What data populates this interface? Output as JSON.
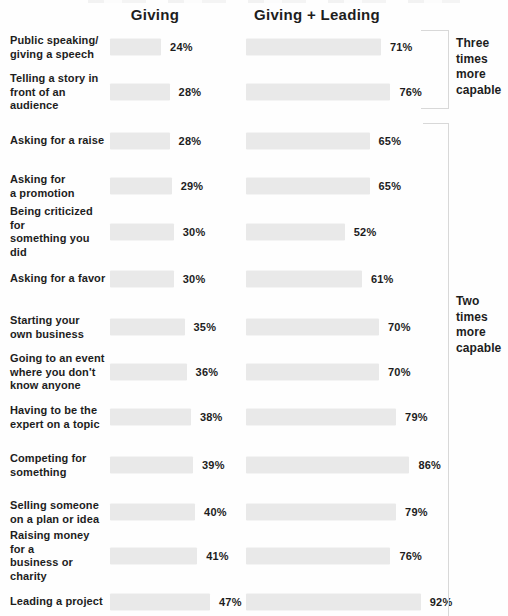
{
  "chart_data": {
    "type": "bar",
    "orientation": "horizontal",
    "title": "",
    "categories": [
      "Public speaking/\ngiving a speech",
      "Telling a story in\nfront of an audience",
      "Asking for a raise",
      "Asking for\na promotion",
      "Being criticized for\nsomething you did",
      "Asking for a favor",
      "Starting your\nown business",
      "Going to an event\nwhere you don't\nknow anyone",
      "Having to be the\nexpert on a topic",
      "Competing for\nsomething",
      "Selling someone\non a plan or idea",
      "Raising money for a\nbusiness or charity",
      "Leading a project"
    ],
    "series": [
      {
        "name": "Giving",
        "values": [
          24,
          28,
          28,
          29,
          30,
          30,
          35,
          36,
          38,
          39,
          40,
          41,
          47
        ]
      },
      {
        "name": "Giving + Leading",
        "values": [
          71,
          76,
          65,
          65,
          52,
          61,
          70,
          70,
          79,
          86,
          79,
          76,
          92
        ]
      }
    ],
    "value_suffix": "%",
    "annotations": [
      {
        "label": "Three times more capable",
        "applies_to_rows": [
          0,
          1
        ]
      },
      {
        "label": "Two times more capable",
        "applies_to_rows": [
          2,
          12
        ]
      }
    ],
    "legend_position": "top-as-column-headers",
    "grid": false,
    "bar_color": "#e9e9e9",
    "text_color": "#1d1d1d",
    "bracket_color": "#d8d8d8",
    "background_color": "#fefefe"
  },
  "headers": {
    "col1": "Giving",
    "col2": "Giving + Leading"
  },
  "annotations": {
    "three": "Three times more capable",
    "two": "Two times more capable"
  }
}
